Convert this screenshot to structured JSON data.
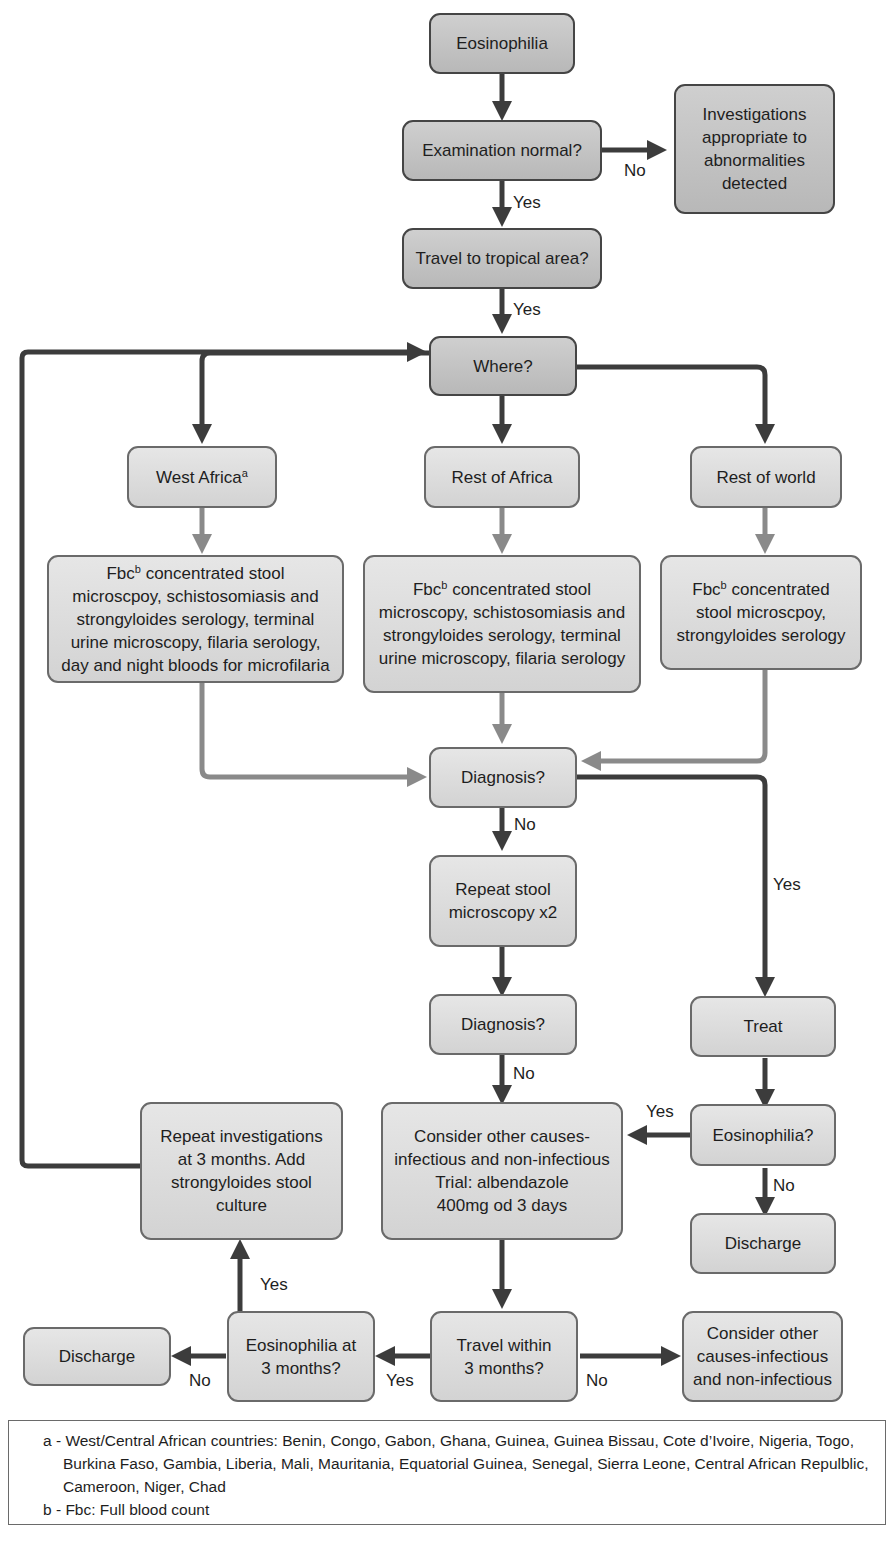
{
  "colors": {
    "box_dark": "#c2c2c2",
    "box_light": "#d8d8d8",
    "arrow_dark": "#3c3c3c",
    "arrow_light": "#8a8a8a",
    "border": "#454545"
  },
  "nodes": {
    "eosinophilia": "Eosinophilia",
    "examination": "Examination normal?",
    "investigations": "Investigations\nappropriate to\nabnormalities\ndetected",
    "travel_tropical": "Travel to tropical area?",
    "where": "Where?",
    "west_africa": "West Africa",
    "west_africa_sup": "a",
    "rest_africa": "Rest of Africa",
    "rest_world": "Rest of world",
    "tests_west_prefix": "Fbc",
    "tests_west_sup": "b",
    "tests_west": " concentrated stool\nmicroscpoy, schistosomiasis and\nstrongyloides serology, terminal\nurine microscopy, filaria serology,\nday and night bloods for microfilaria",
    "tests_rest_africa_prefix": "Fbc",
    "tests_rest_africa_sup": "b",
    "tests_rest_africa": " concentrated stool\nmicroscopy, schistosomiasis and\nstrongyloides serology, terminal\nurine microscopy, filaria serology",
    "tests_rest_world_prefix": "Fbc",
    "tests_rest_world_sup": "b",
    "tests_rest_world": " concentrated\nstool microscpoy,\nstrongyloides serology",
    "diagnosis1": "Diagnosis?",
    "repeat_stool": "Repeat stool\nmicroscopy x2",
    "diagnosis2": "Diagnosis?",
    "treat": "Treat",
    "consider_trial": "Consider other causes-\ninfectious and non-infectious\nTrial: albendazole\n400mg od 3 days",
    "eosinophilia_q": "Eosinophilia?",
    "discharge_right": "Discharge",
    "repeat_investigations": "Repeat investigations\nat 3 months. Add\nstrongyloides stool\nculture",
    "travel_within": "Travel within\n3 months?",
    "eosinophilia_3m": "Eosinophilia at\n3 months?",
    "discharge_left": "Discharge",
    "consider_other": "Consider other\ncauses-infectious\nand non-infectious"
  },
  "labels": {
    "exam_no": "No",
    "exam_yes": "Yes",
    "travel_yes": "Yes",
    "diag1_no": "No",
    "diag1_yes": "Yes",
    "diag2_no": "No",
    "eos_yes": "Yes",
    "eos_no": "No",
    "eos3m_yes": "Yes",
    "eos3m_no": "No",
    "travel_within_yes": "Yes",
    "travel_within_no": "No"
  },
  "footnotes": {
    "a": "a - West/Central African countries: Benin, Congo, Gabon, Ghana, Guinea, Guinea Bissau, Cote d’Ivoire, Nigeria, Togo, Burkina Faso, Gambia, Liberia, Mali, Mauritania, Equatorial Guinea, Senegal, Sierra Leone, Central African Repulblic, Cameroon, Niger, Chad",
    "b": "b - Fbc: Full blood count"
  }
}
